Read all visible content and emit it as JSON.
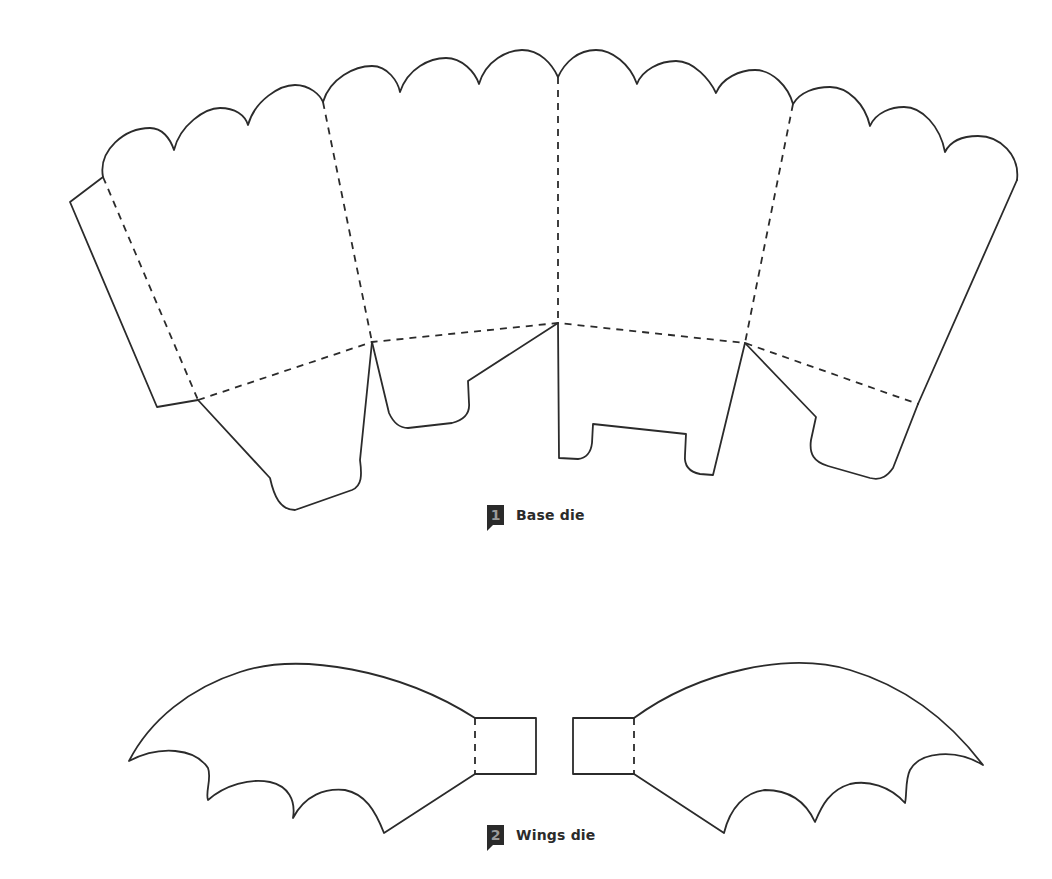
{
  "figures": [
    {
      "number": "1",
      "label": "Base die",
      "description": "Popcorn-box style base net with scalloped top edge, four panels, side glue flap and bottom tabs"
    },
    {
      "number": "2",
      "label": "Wings die",
      "description": "Pair of bat wings with scalloped lower edges and rectangular attachment tabs"
    }
  ],
  "legend": {
    "solid_line": "cut line",
    "dashed_line": "fold line"
  },
  "colors": {
    "line": "#2b2b2b",
    "badge_bg": "#2a2a2a",
    "badge_text": "#9a9a9a",
    "background": "#ffffff"
  }
}
